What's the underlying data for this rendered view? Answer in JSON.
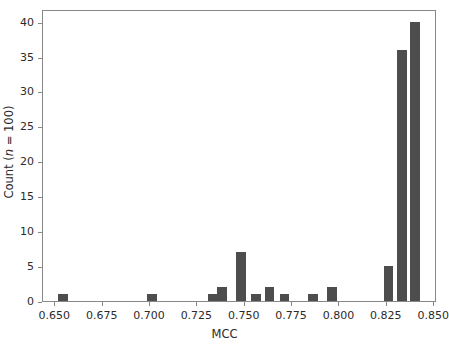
{
  "figure": {
    "background": "#ffffff",
    "axis_color": "#888888",
    "text_color": "#2b2b2b",
    "bar_color": "#4d4d4d"
  },
  "chart_data": {
    "type": "bar",
    "chart_subtype": "histogram",
    "title": "",
    "xlabel": "MCC",
    "ylabel_parts": {
      "prefix": "Count (",
      "italic": "n",
      "suffix": " = 100)"
    },
    "ylabel": "Count (n = 100)",
    "xlim": [
      0.6435,
      0.8515
    ],
    "ylim": [
      0,
      41.8
    ],
    "grid": false,
    "legend": null,
    "bin_width": 0.005,
    "xticks": [
      0.65,
      0.675,
      0.7,
      0.725,
      0.75,
      0.775,
      0.8,
      0.825,
      0.85
    ],
    "xtick_labels": [
      "0.650",
      "0.675",
      "0.700",
      "0.725",
      "0.750",
      "0.775",
      "0.800",
      "0.825",
      "0.850"
    ],
    "yticks": [
      0,
      5,
      10,
      15,
      20,
      25,
      30,
      35,
      40
    ],
    "ytick_labels": [
      "0",
      "5",
      "10",
      "15",
      "20",
      "25",
      "30",
      "35",
      "40"
    ],
    "bins": [
      {
        "x0": 0.6515,
        "x1": 0.6565,
        "count": 1
      },
      {
        "x0": 0.6985,
        "x1": 0.7035,
        "count": 1
      },
      {
        "x0": 0.7305,
        "x1": 0.7355,
        "count": 1
      },
      {
        "x0": 0.7355,
        "x1": 0.7405,
        "count": 2
      },
      {
        "x0": 0.7455,
        "x1": 0.7505,
        "count": 7
      },
      {
        "x0": 0.7535,
        "x1": 0.7585,
        "count": 1
      },
      {
        "x0": 0.7605,
        "x1": 0.7655,
        "count": 2
      },
      {
        "x0": 0.7685,
        "x1": 0.7735,
        "count": 1
      },
      {
        "x0": 0.7835,
        "x1": 0.7885,
        "count": 1
      },
      {
        "x0": 0.7935,
        "x1": 0.7985,
        "count": 2
      },
      {
        "x0": 0.8235,
        "x1": 0.8285,
        "count": 5
      },
      {
        "x0": 0.8305,
        "x1": 0.8355,
        "count": 36
      },
      {
        "x0": 0.8375,
        "x1": 0.8425,
        "count": 40
      }
    ],
    "categories": [
      "0.654",
      "0.701",
      "0.733",
      "0.738",
      "0.748",
      "0.756",
      "0.763",
      "0.771",
      "0.786",
      "0.796",
      "0.826",
      "0.833",
      "0.840"
    ],
    "values": [
      1,
      1,
      1,
      2,
      7,
      1,
      2,
      1,
      1,
      2,
      5,
      36,
      40
    ]
  }
}
